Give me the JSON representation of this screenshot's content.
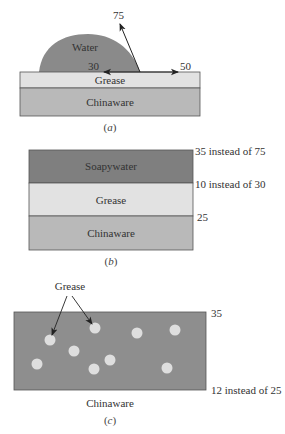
{
  "colors": {
    "water": "#8a8a8a",
    "soapywater": "#7f7f7f",
    "grease": "#e2e2e2",
    "chinaware": "#b9b9b9",
    "chinaware_c": "#8e8e8e",
    "grease_dot": "#dedede",
    "outline": "#555555",
    "arrow": "#222222"
  },
  "panel_a": {
    "caption": "(a)",
    "caption_letter": "a",
    "layers": {
      "water": "Water",
      "grease": "Grease",
      "chinaware": "Chinaware"
    },
    "vectors": {
      "water_air": "75",
      "water_grease": "30",
      "grease_air": "50"
    }
  },
  "panel_b": {
    "caption": "(b)",
    "caption_letter": "b",
    "layers": {
      "soapywater": "Soapywater",
      "grease": "Grease",
      "chinaware": "Chinaware"
    },
    "annotations": {
      "top": "35 instead of 75",
      "middle": "10 instead of 30",
      "bottom": "25"
    }
  },
  "panel_c": {
    "caption": "(c)",
    "caption_letter": "c",
    "grease_label": "Grease",
    "substrate_label": "Chinaware",
    "annotations": {
      "top": "35",
      "bottom": "12 instead of 25"
    },
    "grease_dots": [
      {
        "cx": 50,
        "cy": 340
      },
      {
        "cx": 95,
        "cy": 328
      },
      {
        "cx": 74,
        "cy": 351
      },
      {
        "cx": 37,
        "cy": 364
      },
      {
        "cx": 110,
        "cy": 360
      },
      {
        "cx": 94,
        "cy": 369
      },
      {
        "cx": 137,
        "cy": 333
      },
      {
        "cx": 175,
        "cy": 330
      },
      {
        "cx": 167,
        "cy": 368
      }
    ]
  }
}
